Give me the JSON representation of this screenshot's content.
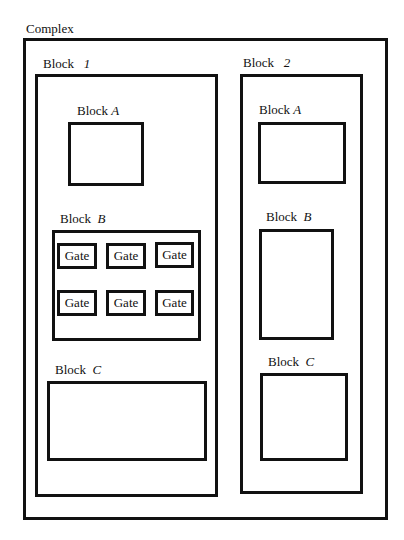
{
  "diagram": {
    "title": "Complex",
    "block1": {
      "label_prefix": "Block",
      "label_id": "1",
      "blockA": {
        "label_prefix": "Block",
        "label_id": "A"
      },
      "blockB": {
        "label_prefix": "Block",
        "label_id": "B",
        "gates": [
          "Gate",
          "Gate",
          "Gate",
          "Gate",
          "Gate",
          "Gate"
        ]
      },
      "blockC": {
        "label_prefix": "Block",
        "label_id": "C"
      }
    },
    "block2": {
      "label_prefix": "Block",
      "label_id": "2",
      "blockA": {
        "label_prefix": "Block",
        "label_id": "A"
      },
      "blockB": {
        "label_prefix": "Block",
        "label_id": "B"
      },
      "blockC": {
        "label_prefix": "Block",
        "label_id": "C"
      }
    }
  }
}
